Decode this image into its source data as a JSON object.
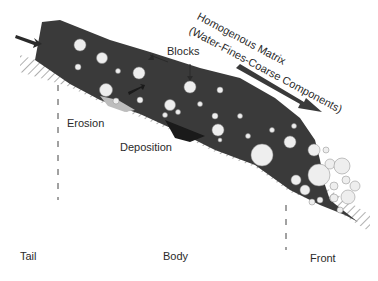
{
  "diagram": {
    "matrix_label_line1": "Homogenous Matrix",
    "matrix_label_line2": "(Water-Fines-Coarse Components)",
    "blocks_label": "Blocks",
    "erosion_label": "Erosion",
    "deposition_label": "Deposition",
    "zones": {
      "tail": "Tail",
      "body": "Body",
      "front": "Front"
    },
    "colors": {
      "flow_body": "#3a3a3a",
      "boulders": "#eeeeee",
      "ground_hatch": "#9a9a9a",
      "deposit": "#1a1a1a",
      "eroded_patch": "#bdbdbd",
      "text": "#2a2a2a"
    }
  }
}
